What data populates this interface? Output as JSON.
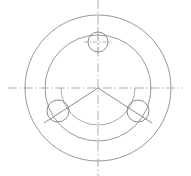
{
  "drawing": {
    "title": "Circular flange plate with three bolt holes",
    "view": "front view",
    "background_color": "#ffffff",
    "line_color": "#8a8a92",
    "centerline_color": "#a0a0a8",
    "canvas": {
      "width": 191,
      "height": 176
    },
    "center": {
      "x": 98,
      "y": 88
    },
    "circles": [
      {
        "name": "outer-circle",
        "cx": 98,
        "cy": 88,
        "r": 73
      },
      {
        "name": "middle-circle",
        "cx": 98,
        "cy": 88,
        "r": 53
      },
      {
        "name": "inner-arc",
        "cx": 98,
        "cy": 88,
        "r": 37
      }
    ],
    "bolt_circle": {
      "name": "bolt-circle",
      "cx": 98,
      "cy": 88,
      "r": 46
    },
    "holes": [
      {
        "name": "hole-top",
        "cx": 98,
        "cy": 42,
        "r": 10,
        "angle_deg": 90
      },
      {
        "name": "hole-lower-left",
        "cx": 58,
        "cy": 111,
        "r": 11,
        "angle_deg": 210
      },
      {
        "name": "hole-lower-right",
        "cx": 138,
        "cy": 111,
        "r": 11,
        "angle_deg": 330
      }
    ],
    "centerlines": [
      {
        "name": "horizontal-centerline",
        "x1": 8,
        "y1": 88,
        "x2": 183,
        "y2": 88
      },
      {
        "name": "vertical-centerline",
        "x1": 98,
        "y1": 0,
        "x2": 98,
        "y2": 176
      }
    ],
    "radial_lines": [
      {
        "name": "radial-line-lower-left",
        "x1": 98,
        "y1": 88,
        "x2": 44,
        "y2": 123
      },
      {
        "name": "radial-line-lower-right",
        "x1": 98,
        "y1": 88,
        "x2": 152,
        "y2": 123
      }
    ],
    "hole_marks": [
      {
        "name": "hole-top-cross-horizontal",
        "x1": 84,
        "y1": 42,
        "x2": 112,
        "y2": 42
      },
      {
        "name": "hole-top-cross-vertical",
        "x1": 98,
        "y1": 28,
        "x2": 98,
        "y2": 56
      }
    ]
  }
}
